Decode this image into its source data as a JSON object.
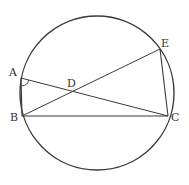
{
  "diagram": {
    "type": "circle-geometry",
    "circle": {
      "cx": 97,
      "cy": 93,
      "r": 77
    },
    "points": {
      "A": {
        "label": "A",
        "x": 21,
        "y": 78,
        "lx": 9,
        "ly": 76
      },
      "B": {
        "label": "B",
        "x": 22,
        "y": 116,
        "lx": 10,
        "ly": 121
      },
      "C": {
        "label": "C",
        "x": 168,
        "y": 116,
        "lx": 171,
        "ly": 121
      },
      "D": {
        "label": "D",
        "x": 74,
        "y": 92,
        "lx": 67,
        "ly": 87
      },
      "E": {
        "label": "E",
        "x": 160,
        "y": 49,
        "lx": 161,
        "ly": 47
      }
    },
    "segments": [
      {
        "from": "A",
        "to": "B"
      },
      {
        "from": "A",
        "to": "C"
      },
      {
        "from": "B",
        "to": "E"
      },
      {
        "from": "B",
        "to": "C"
      },
      {
        "from": "E",
        "to": "C"
      }
    ],
    "angle_marks": [
      {
        "vertex": "A",
        "between": [
          "B",
          "C"
        ]
      }
    ],
    "colors": {
      "line": "#3a3a3a",
      "label": "#333333",
      "background": "#ffffff"
    }
  }
}
